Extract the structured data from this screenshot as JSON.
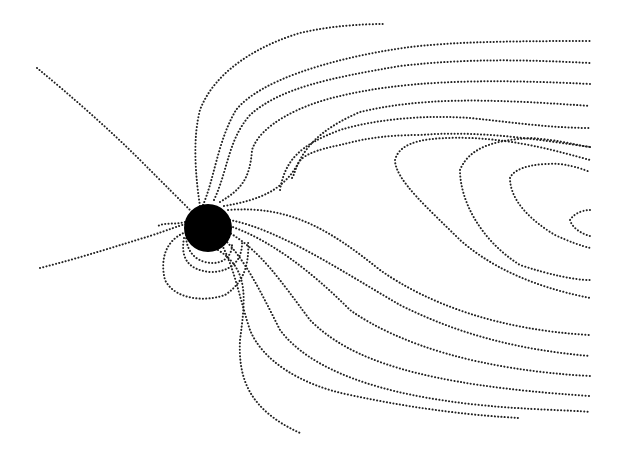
{
  "diagram": {
    "width": 628,
    "height": 457,
    "background": "#ffffff",
    "line_color": "#222222",
    "planet": {
      "label": "planet",
      "cx": 208,
      "cy": 228,
      "r": 24,
      "color": "#000000"
    },
    "field_lines": [
      {
        "id": "open-north-far",
        "d": "M37,68 C70,95 110,130 140,160 C165,185 180,200 192,212"
      },
      {
        "id": "open-south-far",
        "d": "M40,268 C80,258 120,245 150,236 C168,230 178,226 186,224"
      },
      {
        "id": "top-outer",
        "d": "M200,206 C196,180 192,140 200,110 C215,70 260,45 300,33 C330,26 360,24 384,24"
      },
      {
        "id": "tail-1",
        "d": "M203,205 C214,180 218,140 236,110 C260,80 330,60 390,50 C430,43 480,41 590,41"
      },
      {
        "id": "tail-2",
        "d": "M214,200 C228,170 228,140 250,115 C280,88 330,78 400,66 C470,58 530,60 590,63"
      },
      {
        "id": "tail-3",
        "d": "M220,202 C240,190 250,180 252,150 C260,125 300,105 340,96 C400,82 470,78 590,84"
      },
      {
        "id": "closed-1",
        "d": "M224,206 C260,200 285,190 300,160 C310,140 330,125 360,112 C420,98 480,98 590,106"
      },
      {
        "id": "closed-2",
        "d": "M228,210 C290,205 330,230 380,270 C430,305 500,330 590,335",
        "d2": "M280,190 C285,160 300,145 340,130 C380,118 430,115 470,118 C510,122 550,128 590,128"
      },
      {
        "id": "closed-3",
        "d": "M292,178 C300,165 290,155 340,145 C360,140 380,135 420,135 C480,130 540,140 590,147"
      },
      {
        "id": "loop-a",
        "d": "M395,160 C400,140 430,137 470,138 C520,140 560,152 590,160 M395,160 C395,180 430,210 460,240 C500,275 550,290 590,298"
      },
      {
        "id": "loop-b",
        "d": "M460,170 C470,145 500,140 530,138 C560,140 575,145 590,147 M460,170 C460,200 480,240 520,265 C550,275 575,280 590,280"
      },
      {
        "id": "loop-c",
        "d": "M510,178 C515,166 540,163 560,164 C575,166 585,170 590,172 M510,178 C510,200 530,220 555,235 C570,242 582,246 590,248"
      },
      {
        "id": "loop-d",
        "d": "M570,220 C575,212 585,210 590,210 M570,220 C572,228 582,234 590,236"
      },
      {
        "id": "dayside-inner-1",
        "d": "M230,220 C280,230 340,270 400,305 C460,335 520,350 590,356"
      },
      {
        "id": "dayside-inner-2",
        "d": "M230,226 C270,240 310,270 350,310 C400,345 480,370 590,376"
      },
      {
        "id": "dayside-inner-3",
        "d": "M228,232 C260,250 280,280 310,320 C350,360 420,385 590,396"
      },
      {
        "id": "dayside-inner-4",
        "d": "M225,240 C245,260 260,290 280,330 C310,370 380,395 480,405 C530,410 570,410 590,412"
      },
      {
        "id": "dayside-inner-5",
        "d": "M222,245 C235,270 240,300 250,330 C262,360 300,385 350,395 C420,410 480,416 520,418"
      },
      {
        "id": "south-tail",
        "d": "M218,250 C250,270 245,300 240,340 C238,380 250,410 300,433"
      },
      {
        "id": "dipole-1",
        "d": "M186,235 C186,245 190,258 205,262 C220,266 232,258 232,245"
      },
      {
        "id": "dipole-2",
        "d": "M184,238 C180,260 190,270 210,272 C232,272 243,260 242,240"
      },
      {
        "id": "dipole-3",
        "d": "M186,232 C165,240 160,260 165,280 C175,300 205,302 225,295 C240,285 250,270 248,240"
      },
      {
        "id": "west-open",
        "d": "M185,222 C175,225 165,222 158,226"
      }
    ]
  }
}
